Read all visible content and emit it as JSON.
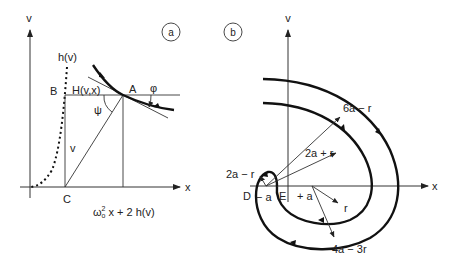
{
  "panel_a": {
    "badge": "a",
    "axis_y_label": "v",
    "axis_x_label": "x",
    "curve_label": "h(v)",
    "point_B": "B",
    "hamiltonian_label": "H(v,x)",
    "point_A": "A",
    "angle_phi": "φ",
    "angle_psi": "ψ",
    "segment_v": "v",
    "point_C": "C",
    "x_expr_omega": "ω",
    "x_expr_sup": "2",
    "x_expr_sub": "o",
    "x_expr_rest": " x + 2 h(v)"
  },
  "panel_b": {
    "badge": "b",
    "axis_y_label": "v",
    "axis_x_label": "x",
    "radius_outer": "6a − r",
    "radius_inner": "2a + r",
    "radius_small": "2a − r",
    "point_D": "D",
    "point_E": "E",
    "minus_a": "− a",
    "plus_a": "+ a",
    "radius_r": "r",
    "radius_bottom": "4a − 3r"
  }
}
